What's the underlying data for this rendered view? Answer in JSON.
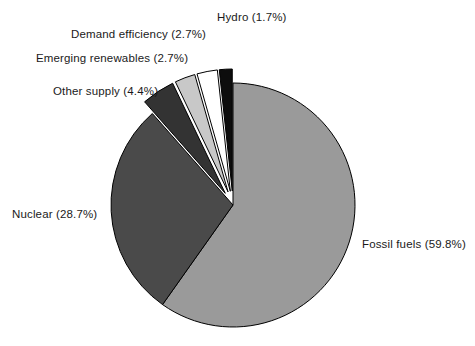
{
  "figure": {
    "width": 475,
    "height": 346,
    "background": "#ffffff",
    "label_color": "#1a1a1a"
  },
  "pie_geometry": {
    "center_x": 233,
    "center_y": 205,
    "radius": 122,
    "start_angle_deg": -90,
    "direction": "clockwise",
    "explode_offset_px": 14
  },
  "chart_data": {
    "type": "pie",
    "title": "",
    "xlabel": "",
    "ylabel": "",
    "legend_position": "none",
    "grid": false,
    "units": "percent",
    "categories": [
      "Fossil fuels",
      "Nuclear",
      "Other supply",
      "Emerging renewables",
      "Demand efficiency",
      "Hydro"
    ],
    "values": [
      59.8,
      28.7,
      4.4,
      2.7,
      2.7,
      1.7
    ],
    "colors": [
      "#9a9a9a",
      "#4a4a4a",
      "#333333",
      "#c8c8c8",
      "#ffffff",
      "#0d0d0d"
    ],
    "exploded": [
      false,
      false,
      true,
      true,
      true,
      true
    ],
    "slices": [
      {
        "name": "Fossil fuels",
        "value": 59.8,
        "color": "#9a9a9a",
        "exploded": false,
        "label": "Fossil fuels (59.8%)"
      },
      {
        "name": "Nuclear",
        "value": 28.7,
        "color": "#4a4a4a",
        "exploded": false,
        "label": "Nuclear (28.7%)"
      },
      {
        "name": "Other supply",
        "value": 4.4,
        "color": "#333333",
        "exploded": true,
        "label": "Other supply (4.4%)"
      },
      {
        "name": "Emerging renewables",
        "value": 2.7,
        "color": "#c8c8c8",
        "exploded": true,
        "label": "Emerging renewables (2.7%)"
      },
      {
        "name": "Demand efficiency",
        "value": 2.7,
        "color": "#ffffff",
        "exploded": true,
        "label": "Demand efficiency (2.7%)"
      },
      {
        "name": "Hydro",
        "value": 1.7,
        "color": "#0d0d0d",
        "exploded": true,
        "label": "Hydro (1.7%)"
      }
    ]
  },
  "labels": {
    "fossil_fuels": "Fossil fuels (59.8%)",
    "nuclear": "Nuclear (28.7%)",
    "other_supply": "Other supply (4.4%)",
    "emerging_renewables": "Emerging renewables (2.7%)",
    "demand_efficiency": "Demand efficiency (2.7%)",
    "hydro": "Hydro (1.7%)"
  }
}
